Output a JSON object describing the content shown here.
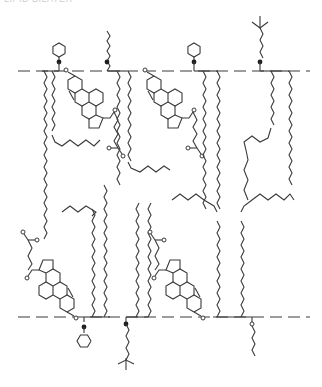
{
  "diagram": {
    "title_clipped": "LIPID BILAYER",
    "type": "lipid-bilayer-membrane",
    "colors": {
      "line": "#3a3a3a",
      "background": "#ffffff"
    },
    "membrane": {
      "top_surface_y": 71,
      "bottom_surface_y": 317,
      "outer_leaflet": [
        {
          "kind": "phospholipid",
          "headgroup": "inositol-ring",
          "x": 59
        },
        {
          "kind": "cholesterol",
          "x": 76
        },
        {
          "kind": "phospholipid",
          "headgroup": "alkyl-chain",
          "x": 107
        },
        {
          "kind": "cholesterol",
          "x": 154
        },
        {
          "kind": "phospholipid",
          "headgroup": "inositol-ring",
          "x": 194
        },
        {
          "kind": "phospholipid",
          "headgroup": "tert-butyl-alkyl",
          "x": 260
        }
      ],
      "inner_leaflet": [
        {
          "kind": "cholesterol",
          "x": 76
        },
        {
          "kind": "phospholipid",
          "headgroup": "inositol-ring",
          "x": 84
        },
        {
          "kind": "phospholipid",
          "headgroup": "tert-butyl-alkyl",
          "x": 126
        },
        {
          "kind": "cholesterol",
          "x": 203
        },
        {
          "kind": "phospholipid",
          "headgroup": "alkyl-chain",
          "x": 252
        }
      ]
    }
  }
}
